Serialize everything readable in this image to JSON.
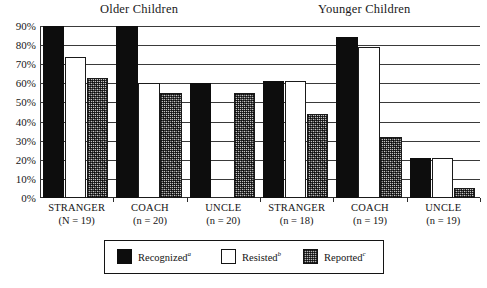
{
  "chart_data": {
    "type": "bar",
    "title": "",
    "xlabel": "",
    "ylabel": "",
    "ylim": [
      0,
      90
    ],
    "ytick_labels": [
      "0%",
      "10%",
      "20%",
      "30%",
      "40%",
      "50%",
      "60%",
      "70%",
      "80%",
      "90%"
    ],
    "ytick_values": [
      0,
      10,
      20,
      30,
      40,
      50,
      60,
      70,
      80,
      90
    ],
    "grid": true,
    "legend_position": "bottom",
    "note": "Recognized bars for STRANGER (N=19) and COACH (n=20) in the Older Children group reach or exceed the 90% top of the axis and are clipped at the plot top.",
    "group_headers": [
      {
        "label": "Older Children",
        "categories": [
          0,
          1,
          2
        ]
      },
      {
        "label": "Younger Children",
        "categories": [
          3,
          4,
          5
        ]
      }
    ],
    "categories": [
      {
        "name": "STRANGER",
        "n": "(N = 19)"
      },
      {
        "name": "COACH",
        "n": "(n = 20)"
      },
      {
        "name": "UNCLE",
        "n": "(n = 20)"
      },
      {
        "name": "STRANGER",
        "n": "(n = 18)"
      },
      {
        "name": "COACH",
        "n": "(n = 19)"
      },
      {
        "name": "UNCLE",
        "n": "(n = 19)"
      }
    ],
    "series": [
      {
        "name": "Recognized",
        "superscript": "a",
        "fill": "solid-black",
        "color": "#0d0d0d",
        "values": [
          90,
          90,
          60,
          61,
          84,
          21
        ]
      },
      {
        "name": "Resisted",
        "superscript": "b",
        "fill": "white-outline",
        "color": "#ffffff",
        "values": [
          74,
          60,
          0,
          61,
          79,
          21
        ]
      },
      {
        "name": "Reported",
        "superscript": "c",
        "fill": "speckled-gray",
        "color": "#8d8d8d",
        "values": [
          63,
          55,
          55,
          44,
          32,
          5
        ]
      }
    ]
  },
  "legend": {
    "items": [
      {
        "label": "Recognized",
        "superscript": "a",
        "swatch": "solid-black"
      },
      {
        "label": "Resisted",
        "superscript": "b",
        "swatch": "white-outline"
      },
      {
        "label": "Reported",
        "superscript": "c",
        "swatch": "speckled-gray"
      }
    ]
  }
}
